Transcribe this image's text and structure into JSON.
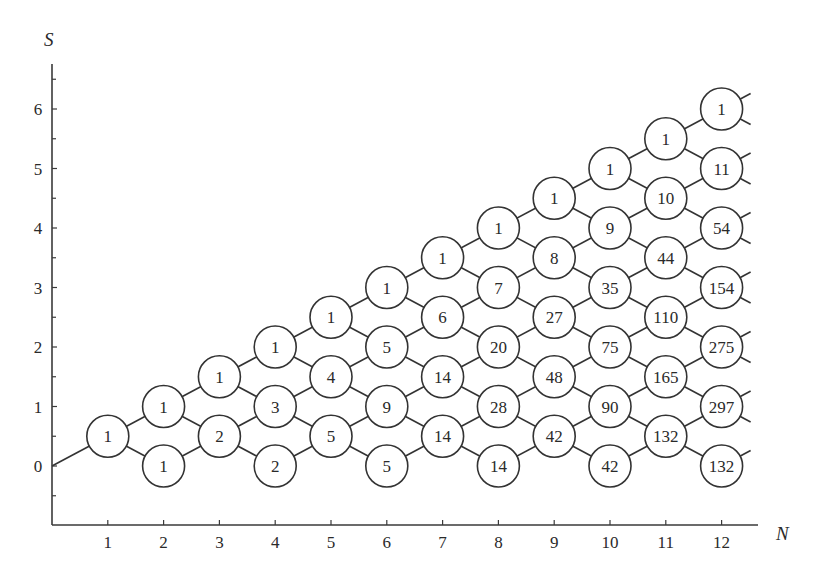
{
  "diagram": {
    "axes": {
      "x_label": "N",
      "y_label": "S",
      "x_ticks": [
        "1",
        "2",
        "3",
        "4",
        "5",
        "6",
        "7",
        "8",
        "9",
        "10",
        "11",
        "12"
      ],
      "y_ticks": [
        "0",
        "1",
        "2",
        "3",
        "4",
        "5",
        "6"
      ]
    },
    "origin_node": {
      "N": 0,
      "S": 0
    },
    "columns": [
      {
        "N": 1,
        "values": [
          1
        ]
      },
      {
        "N": 2,
        "values": [
          1,
          1
        ]
      },
      {
        "N": 3,
        "values": [
          1,
          2
        ]
      },
      {
        "N": 4,
        "values": [
          1,
          3,
          2
        ]
      },
      {
        "N": 5,
        "values": [
          1,
          4,
          5
        ]
      },
      {
        "N": 6,
        "values": [
          1,
          5,
          9,
          5
        ]
      },
      {
        "N": 7,
        "values": [
          1,
          6,
          14,
          14
        ]
      },
      {
        "N": 8,
        "values": [
          1,
          7,
          20,
          28,
          14
        ]
      },
      {
        "N": 9,
        "values": [
          1,
          8,
          27,
          48,
          42
        ]
      },
      {
        "N": 10,
        "values": [
          1,
          9,
          35,
          75,
          90,
          42
        ]
      },
      {
        "N": 11,
        "values": [
          1,
          10,
          44,
          110,
          165,
          132
        ]
      },
      {
        "N": 12,
        "values": [
          1,
          11,
          54,
          154,
          275,
          297,
          132
        ]
      }
    ],
    "colors": {
      "line": "#333333",
      "background": "#ffffff",
      "text": "#2a2a2a"
    }
  },
  "chart_data": {
    "type": "table",
    "title": "",
    "xlabel": "N",
    "ylabel": "S",
    "x": [
      1,
      2,
      3,
      4,
      5,
      6,
      7,
      8,
      9,
      10,
      11,
      12
    ],
    "nodes": [
      {
        "N": 1,
        "S": 0.5,
        "value": 1
      },
      {
        "N": 2,
        "S": 1,
        "value": 1
      },
      {
        "N": 2,
        "S": 0,
        "value": 1
      },
      {
        "N": 3,
        "S": 1.5,
        "value": 1
      },
      {
        "N": 3,
        "S": 0.5,
        "value": 2
      },
      {
        "N": 4,
        "S": 2,
        "value": 1
      },
      {
        "N": 4,
        "S": 1,
        "value": 3
      },
      {
        "N": 4,
        "S": 0,
        "value": 2
      },
      {
        "N": 5,
        "S": 2.5,
        "value": 1
      },
      {
        "N": 5,
        "S": 1.5,
        "value": 4
      },
      {
        "N": 5,
        "S": 0.5,
        "value": 5
      },
      {
        "N": 6,
        "S": 3,
        "value": 1
      },
      {
        "N": 6,
        "S": 2,
        "value": 5
      },
      {
        "N": 6,
        "S": 1,
        "value": 9
      },
      {
        "N": 6,
        "S": 0,
        "value": 5
      },
      {
        "N": 7,
        "S": 3.5,
        "value": 1
      },
      {
        "N": 7,
        "S": 2.5,
        "value": 6
      },
      {
        "N": 7,
        "S": 1.5,
        "value": 14
      },
      {
        "N": 7,
        "S": 0.5,
        "value": 14
      },
      {
        "N": 8,
        "S": 4,
        "value": 1
      },
      {
        "N": 8,
        "S": 3,
        "value": 7
      },
      {
        "N": 8,
        "S": 2,
        "value": 20
      },
      {
        "N": 8,
        "S": 1,
        "value": 28
      },
      {
        "N": 8,
        "S": 0,
        "value": 14
      },
      {
        "N": 9,
        "S": 4.5,
        "value": 1
      },
      {
        "N": 9,
        "S": 3.5,
        "value": 8
      },
      {
        "N": 9,
        "S": 2.5,
        "value": 27
      },
      {
        "N": 9,
        "S": 1.5,
        "value": 48
      },
      {
        "N": 9,
        "S": 0.5,
        "value": 42
      },
      {
        "N": 10,
        "S": 5,
        "value": 1
      },
      {
        "N": 10,
        "S": 4,
        "value": 9
      },
      {
        "N": 10,
        "S": 3,
        "value": 35
      },
      {
        "N": 10,
        "S": 2,
        "value": 75
      },
      {
        "N": 10,
        "S": 1,
        "value": 90
      },
      {
        "N": 10,
        "S": 0,
        "value": 42
      },
      {
        "N": 11,
        "S": 5.5,
        "value": 1
      },
      {
        "N": 11,
        "S": 4.5,
        "value": 10
      },
      {
        "N": 11,
        "S": 3.5,
        "value": 44
      },
      {
        "N": 11,
        "S": 2.5,
        "value": 110
      },
      {
        "N": 11,
        "S": 1.5,
        "value": 165
      },
      {
        "N": 11,
        "S": 0.5,
        "value": 132
      },
      {
        "N": 12,
        "S": 6,
        "value": 1
      },
      {
        "N": 12,
        "S": 5,
        "value": 11
      },
      {
        "N": 12,
        "S": 4,
        "value": 54
      },
      {
        "N": 12,
        "S": 3,
        "value": 154
      },
      {
        "N": 12,
        "S": 2,
        "value": 275
      },
      {
        "N": 12,
        "S": 1,
        "value": 297
      },
      {
        "N": 12,
        "S": 0,
        "value": 132
      }
    ],
    "xlim": [
      0,
      12.5
    ],
    "ylim": [
      -1,
      6.7
    ],
    "x_ticks": [
      1,
      2,
      3,
      4,
      5,
      6,
      7,
      8,
      9,
      10,
      11,
      12
    ],
    "y_ticks": [
      0,
      1,
      2,
      3,
      4,
      5,
      6
    ],
    "y_minor_ticks": [
      -0.5,
      0.5,
      1.5,
      2.5,
      3.5,
      4.5,
      5.5,
      6.5
    ],
    "grid": false,
    "legend": null
  }
}
